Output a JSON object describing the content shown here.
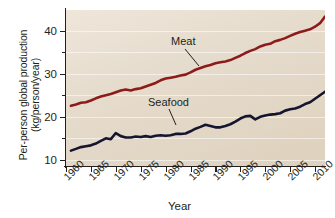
{
  "chart_data": {
    "type": "line",
    "title": "",
    "xlabel": "Year",
    "ylabel": "Per-person global production (kg/person/year)",
    "ylabel_line1": "Per-person global production",
    "ylabel_line2": "(kg/person/year)",
    "xlim": [
      1960,
      2012
    ],
    "ylim": [
      9.5,
      45
    ],
    "yticks": [
      10,
      20,
      30,
      40
    ],
    "ytick_labels": [
      "10",
      "20",
      "30",
      "40"
    ],
    "yticks_minor": [
      15,
      25,
      35
    ],
    "xticks": [
      1960,
      1965,
      1970,
      1975,
      1980,
      1985,
      1990,
      1995,
      2000,
      2005,
      2010
    ],
    "xtick_labels": [
      "1960",
      "1965",
      "1970",
      "1975",
      "1980",
      "1985",
      "1990",
      "1995",
      "2000",
      "2005",
      "2010"
    ],
    "grid": true,
    "grid_color": "#ffffff",
    "plot_background": "#e6dccd",
    "legend_position": "inline-annotations",
    "x": [
      1961,
      1962,
      1963,
      1964,
      1965,
      1966,
      1967,
      1968,
      1969,
      1970,
      1971,
      1972,
      1973,
      1974,
      1975,
      1976,
      1977,
      1978,
      1979,
      1980,
      1981,
      1982,
      1983,
      1984,
      1985,
      1986,
      1987,
      1988,
      1989,
      1990,
      1991,
      1992,
      1993,
      1994,
      1995,
      1996,
      1997,
      1998,
      1999,
      2000,
      2001,
      2002,
      2003,
      2004,
      2005,
      2006,
      2007,
      2008,
      2009,
      2010,
      2011,
      2012
    ],
    "series": [
      {
        "name": "Meat",
        "label": "Meat",
        "color": "#8e1b1b",
        "values": [
          23.2,
          23.5,
          23.9,
          24.0,
          24.4,
          24.9,
          25.3,
          25.6,
          25.9,
          26.3,
          26.7,
          26.9,
          26.7,
          27.0,
          27.2,
          27.6,
          28.0,
          28.4,
          29.0,
          29.4,
          29.6,
          29.8,
          30.1,
          30.3,
          30.8,
          31.4,
          31.8,
          32.2,
          32.5,
          32.9,
          33.1,
          33.3,
          33.6,
          34.1,
          34.6,
          35.2,
          35.7,
          36.1,
          36.7,
          37.1,
          37.3,
          37.9,
          38.2,
          38.6,
          39.1,
          39.6,
          40.0,
          40.3,
          40.6,
          41.2,
          42.0,
          43.5
        ]
      },
      {
        "name": "Seafood",
        "label": "Seafood",
        "color": "#15152f",
        "values": [
          13.0,
          13.4,
          13.8,
          14.0,
          14.2,
          14.6,
          15.2,
          15.8,
          15.6,
          17.0,
          16.3,
          16.0,
          16.0,
          16.2,
          16.1,
          16.3,
          16.1,
          16.4,
          16.5,
          16.4,
          16.5,
          16.8,
          16.8,
          16.9,
          17.4,
          18.0,
          18.4,
          18.9,
          18.6,
          18.3,
          18.3,
          18.6,
          19.0,
          19.6,
          20.3,
          20.8,
          20.9,
          20.1,
          20.7,
          21.0,
          21.2,
          21.3,
          21.5,
          22.1,
          22.4,
          22.6,
          23.0,
          23.6,
          24.0,
          24.8,
          25.6,
          26.4
        ]
      }
    ],
    "annotations": [
      {
        "name": "meat-label",
        "text": "Meat",
        "points_to_series": "Meat"
      },
      {
        "name": "seafood-label",
        "text": "Seafood",
        "points_to_series": "Seafood"
      }
    ],
    "illustrations": [
      {
        "name": "cow-illustration",
        "subject": "cow",
        "color": "#2b1b16"
      },
      {
        "name": "pig-illustration",
        "subject": "pig",
        "color": "#e8c9c4"
      },
      {
        "name": "chicken-illustration",
        "subject": "chicken",
        "color": "#f2f0ea"
      },
      {
        "name": "fish-illustration",
        "subject": "fish",
        "color": "#b79134"
      }
    ]
  }
}
